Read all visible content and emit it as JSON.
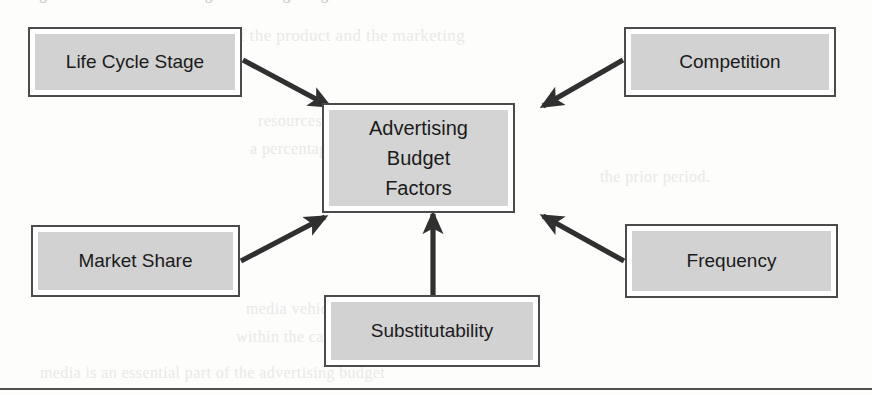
{
  "figure": {
    "title_clipped": "Figure 1. Factors Influencing Advertising Budget",
    "center_label": "Advertising\nBudget\nFactors",
    "center_line1": "Advertising",
    "center_line2": "Budget",
    "center_line3": "Factors"
  },
  "nodes": [
    {
      "id": "life-cycle-stage",
      "label": "Life Cycle Stage",
      "position": "top-left"
    },
    {
      "id": "competition",
      "label": "Competition",
      "position": "top-right"
    },
    {
      "id": "advertising-budget-factors",
      "label": "Advertising Budget Factors",
      "position": "center"
    },
    {
      "id": "market-share",
      "label": "Market Share",
      "position": "middle-left"
    },
    {
      "id": "frequency",
      "label": "Frequency",
      "position": "middle-right"
    },
    {
      "id": "substitutability",
      "label": "Substitutability",
      "position": "bottom-center"
    }
  ],
  "connectors": [
    {
      "id": "arrow-life-cycle-stage-to-center",
      "from": "life-cycle-stage",
      "to": "advertising-budget-factors",
      "direction": "down-right"
    },
    {
      "id": "arrow-competition-to-center",
      "from": "competition",
      "to": "advertising-budget-factors",
      "direction": "down-left"
    },
    {
      "id": "arrow-market-share-to-center",
      "from": "market-share",
      "to": "advertising-budget-factors",
      "direction": "up-right"
    },
    {
      "id": "arrow-frequency-to-center",
      "from": "frequency",
      "to": "advertising-budget-factors",
      "direction": "up-left"
    },
    {
      "id": "arrow-substitutability-to-center",
      "from": "substitutability",
      "to": "advertising-budget-factors",
      "direction": "up"
    }
  ],
  "colors": {
    "box_fill": "#d2d2d2",
    "box_border": "#4b4b4b",
    "box_inset": "#ffffff",
    "arrow": "#303030",
    "text": "#1b1b1b",
    "page_background": "#fdfdfc",
    "rule": "#51514f"
  },
  "ghost_text": [
    "of the product and the marketing",
    "resources. Most companies determine",
    "a percentage of sales and adjust the",
    "the prior period.",
    "media vehicles and the frequency of",
    "within the campaign planning phase",
    "media is an essential part of the advertising budget"
  ]
}
